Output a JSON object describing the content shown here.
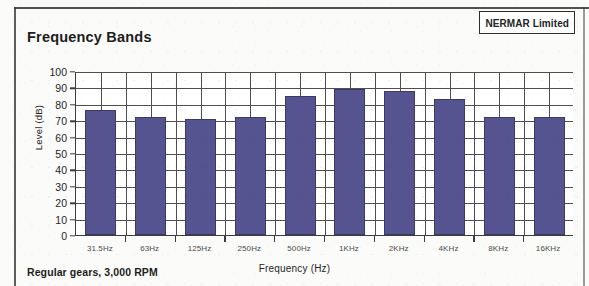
{
  "header": {
    "title": "Frequency Bands",
    "company_label": "NERMAR Limited"
  },
  "caption": "Regular gears, 3,000 RPM",
  "chart_data": {
    "type": "bar",
    "title": "Frequency Bands",
    "xlabel": "Frequency (Hz)",
    "ylabel": "Level (dB)",
    "categories": [
      "31.5Hz",
      "63Hz",
      "125Hz",
      "250Hz",
      "500Hz",
      "1KHz",
      "2KHz",
      "4KHz",
      "8KHz",
      "16KHz"
    ],
    "values": [
      76,
      72,
      71,
      72,
      85,
      89,
      88,
      83,
      72,
      72
    ],
    "series": [
      {
        "name": "Level",
        "values": [
          76,
          72,
          71,
          72,
          85,
          89,
          88,
          83,
          72,
          72
        ]
      }
    ],
    "ylim": [
      0,
      100
    ],
    "ytick_labels": [
      "100",
      "90",
      "80",
      "70",
      "60",
      "50",
      "40",
      "30",
      "20",
      "10",
      "0"
    ],
    "ytick_values": [
      100,
      90,
      80,
      70,
      60,
      50,
      40,
      30,
      20,
      10,
      0
    ],
    "grid": true,
    "legend": "none",
    "bar_color": "#565490",
    "grid_color": "#4f4f4f",
    "axis_color": "#3c3c3c"
  }
}
